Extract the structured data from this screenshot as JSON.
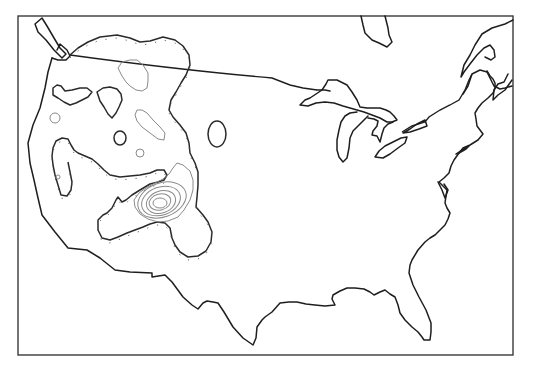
{
  "map": {
    "title": "",
    "description": "Contour map of the contiguous United States with hachured closed contours over the western region",
    "width": 544,
    "height": 366,
    "frame": {
      "x": 18,
      "y": 16,
      "width": 495,
      "height": 339
    },
    "colors": {
      "background": "#ffffff",
      "coastline": "#1e1e1e",
      "border": "#1e1e1e",
      "contour_major": "#2a2a2a",
      "contour_minor": "#8a8a8a",
      "frame": "#3a3a3a"
    },
    "layers": [
      {
        "id": "coastline",
        "label": "Coastline / shorelines"
      },
      {
        "id": "international-border",
        "label": "US–Canada border"
      },
      {
        "id": "great-lakes",
        "label": "Great Lakes"
      },
      {
        "id": "hudson-bay",
        "label": "James Bay"
      },
      {
        "id": "contours-major",
        "label": "Major hachured contours"
      },
      {
        "id": "contours-minor",
        "label": "Minor hachured contours"
      },
      {
        "id": "contour-cluster",
        "label": "Concentric contour cluster (Southwest)"
      }
    ],
    "text_labels": []
  }
}
